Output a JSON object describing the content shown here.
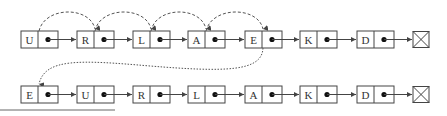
{
  "diagram": {
    "type": "linked-list-move-to-front",
    "colors": {
      "stroke": "#444444",
      "dash": "#555555",
      "background": "#ffffff"
    },
    "top_row": {
      "nodes": [
        {
          "letter": "U",
          "x": 21
        },
        {
          "letter": "R",
          "x": 77
        },
        {
          "letter": "L",
          "x": 133
        },
        {
          "letter": "A",
          "x": 188
        },
        {
          "letter": "E",
          "x": 245
        },
        {
          "letter": "K",
          "x": 300
        },
        {
          "letter": "D",
          "x": 357
        }
      ],
      "null_terminator": {
        "x": 413
      },
      "search_arcs": [
        "U→R",
        "R→L",
        "L→A",
        "A→E"
      ]
    },
    "bottom_row": {
      "nodes": [
        {
          "letter": "E",
          "x": 21
        },
        {
          "letter": "U",
          "x": 77
        },
        {
          "letter": "R",
          "x": 133
        },
        {
          "letter": "L",
          "x": 188
        },
        {
          "letter": "A",
          "x": 245
        },
        {
          "letter": "K",
          "x": 300
        },
        {
          "letter": "D",
          "x": 357
        }
      ],
      "null_terminator": {
        "x": 413
      }
    },
    "move_arrow": {
      "from": "E (top row)",
      "to": "front of list (bottom row)"
    }
  }
}
